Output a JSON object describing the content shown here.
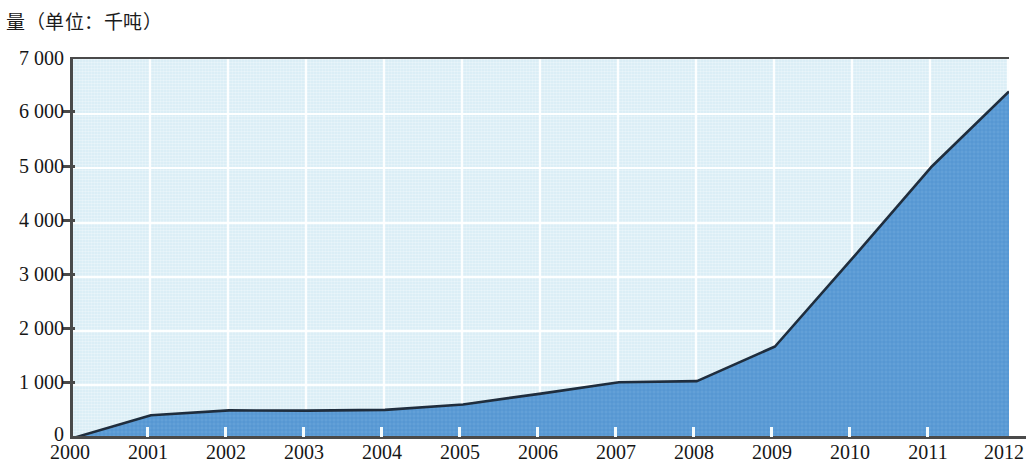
{
  "chart_data": {
    "type": "area",
    "title": "量（单位：千吨）",
    "xlabel": "",
    "ylabel": "量（单位：千吨）",
    "unit": "千吨",
    "categories": [
      "2000",
      "2001",
      "2002",
      "2003",
      "2004",
      "2005",
      "2006",
      "2007",
      "2008",
      "2009",
      "2010",
      "2011",
      "2012"
    ],
    "x": [
      2000,
      2001,
      2002,
      2003,
      2004,
      2005,
      2006,
      2007,
      2008,
      2009,
      2010,
      2011,
      2012
    ],
    "values": [
      0,
      420,
      510,
      505,
      520,
      620,
      820,
      1030,
      1050,
      1690,
      3330,
      5000,
      6400
    ],
    "series": [
      {
        "name": "量",
        "values": [
          0,
          420,
          510,
          505,
          520,
          620,
          820,
          1030,
          1050,
          1690,
          3330,
          5000,
          6400
        ]
      }
    ],
    "ylim": [
      0,
      7000
    ],
    "xlim": [
      2000,
      2012
    ],
    "y_ticks": [
      0,
      1000,
      2000,
      3000,
      4000,
      5000,
      6000,
      7000
    ],
    "y_tick_labels": [
      "0",
      "1 000",
      "2 000",
      "3 000",
      "4 000",
      "5 000",
      "6 000",
      "7 000"
    ],
    "x_tick_labels": [
      "2000",
      "2001",
      "2002",
      "2003",
      "2004",
      "2005",
      "2006",
      "2007",
      "2008",
      "2009",
      "2010",
      "2011",
      "2012"
    ],
    "grid": true,
    "legend": false,
    "colors": {
      "area_fill": "#5b9bd5",
      "line": "#1f2d3d",
      "plot_background": "#dbeef6",
      "gridline": "#ffffff",
      "axis": "#4a4a4a",
      "text": "#161616"
    }
  }
}
